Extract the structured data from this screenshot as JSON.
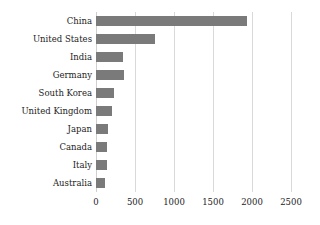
{
  "chart_data": {
    "type": "bar",
    "orientation": "horizontal",
    "title": "",
    "subtitle": "",
    "xlabel": "",
    "ylabel": "",
    "categories": [
      "China",
      "United States",
      "India",
      "Germany",
      "South Korea",
      "United Kingdom",
      "Japan",
      "Canada",
      "Italy",
      "Australia"
    ],
    "values": [
      1930,
      750,
      350,
      355,
      230,
      205,
      155,
      145,
      135,
      115
    ],
    "xlim": [
      0,
      2500
    ],
    "xticks": [
      0,
      500,
      1000,
      1500,
      2000,
      2500
    ],
    "xtick_labels": [
      "0",
      "500",
      "1000",
      "1500",
      "2000",
      "2500"
    ],
    "grid": "vertical",
    "legend": "none",
    "bar_color": "#7a7a7a",
    "gridline_color": "#d9d9d9",
    "text_color": "#1c1c1c",
    "background_color": "#ffffff"
  }
}
